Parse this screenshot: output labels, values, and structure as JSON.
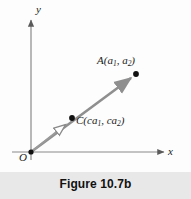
{
  "figure": {
    "caption": "Figure 10.7b",
    "background_color": "#fdfdfd",
    "caption_band_color": "#e8e8e8"
  },
  "axes": {
    "x_label": "x",
    "y_label": "y",
    "origin_label": "O",
    "axis_color": "#8a8a8a",
    "origin_px": [
      31,
      152
    ],
    "x_axis_end_px": [
      166,
      152
    ],
    "y_axis_end_px": [
      31,
      18
    ]
  },
  "points": [
    {
      "id": "A",
      "label_text": "A(a",
      "label_sub1": "1",
      "label_mid": ", a",
      "label_sub2": "2",
      "label_end": ")",
      "full_label": "A(a1, a2)",
      "px": [
        136,
        74
      ],
      "marker_color": "#111111"
    },
    {
      "id": "C",
      "label_text": "C(ca",
      "label_sub1": "1",
      "label_mid": ", ca",
      "label_sub2": "2",
      "label_end": ")",
      "full_label": "C(ca1, ca2)",
      "px": [
        72,
        118
      ],
      "marker_color": "#111111"
    }
  ],
  "vectors": [
    {
      "id": "OA",
      "from": "O",
      "to": "A",
      "arrowhead_style": "solid",
      "color": "#8f8f8f"
    },
    {
      "id": "OC",
      "from": "O",
      "to": "C",
      "arrowhead_style": "hollow",
      "color": "#9a9a9a"
    }
  ]
}
